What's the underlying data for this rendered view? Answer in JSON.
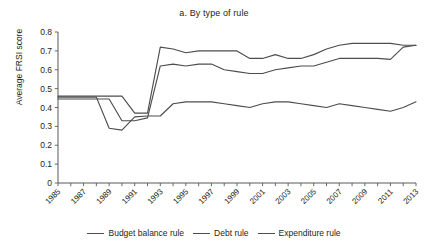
{
  "chart_data": {
    "type": "line",
    "title": "a. By type of rule",
    "xlabel": "",
    "ylabel": "Average FRSI score",
    "ylim": [
      0,
      0.8
    ],
    "ytick_step": 0.1,
    "yticks": [
      "0",
      "0.1",
      "0.2",
      "0.3",
      "0.4",
      "0.5",
      "0.6",
      "0.7",
      "0.8"
    ],
    "xlim": [
      1985,
      2013
    ],
    "grid": false,
    "legend_position": "bottom",
    "x": [
      1985,
      1986,
      1987,
      1988,
      1989,
      1990,
      1991,
      1992,
      1993,
      1994,
      1995,
      1996,
      1997,
      1998,
      1999,
      2000,
      2001,
      2002,
      2003,
      2004,
      2005,
      2006,
      2007,
      2008,
      2009,
      2010,
      2011,
      2012,
      2013
    ],
    "xtick_labels": [
      "1985",
      "",
      "1987",
      "",
      "1989",
      "",
      "1991",
      "",
      "1993",
      "",
      "1995",
      "",
      "1997",
      "",
      "1999",
      "",
      "2001",
      "",
      "2003",
      "",
      "2005",
      "",
      "2007",
      "",
      "2009",
      "",
      "2011",
      "",
      "2013"
    ],
    "series": [
      {
        "name": "Budget balance rule",
        "color": "#4d4d4f",
        "values": [
          0.46,
          0.46,
          0.46,
          0.46,
          0.46,
          0.46,
          0.37,
          0.37,
          0.72,
          0.71,
          0.69,
          0.7,
          0.7,
          0.7,
          0.7,
          0.66,
          0.66,
          0.68,
          0.66,
          0.66,
          0.68,
          0.71,
          0.73,
          0.74,
          0.74,
          0.74,
          0.74,
          0.73,
          0.73
        ]
      },
      {
        "name": "Debt rule",
        "color": "#4d4d4f",
        "values": [
          0.445,
          0.445,
          0.445,
          0.445,
          0.445,
          0.33,
          0.33,
          0.345,
          0.62,
          0.63,
          0.62,
          0.63,
          0.63,
          0.6,
          0.59,
          0.58,
          0.58,
          0.6,
          0.61,
          0.62,
          0.62,
          0.64,
          0.66,
          0.66,
          0.66,
          0.66,
          0.655,
          0.72,
          0.73
        ]
      },
      {
        "name": "Expenditure rule",
        "color": "#4d4d4f",
        "values": [
          0.455,
          0.455,
          0.455,
          0.455,
          0.29,
          0.28,
          0.35,
          0.355,
          0.355,
          0.42,
          0.43,
          0.43,
          0.43,
          0.42,
          0.41,
          0.4,
          0.42,
          0.43,
          0.43,
          0.42,
          0.41,
          0.4,
          0.42,
          0.41,
          0.4,
          0.39,
          0.38,
          0.4,
          0.43
        ]
      }
    ]
  },
  "legend": {
    "items": [
      {
        "label": "Budget balance rule"
      },
      {
        "label": "Debt rule"
      },
      {
        "label": "Expenditure rule"
      }
    ]
  }
}
